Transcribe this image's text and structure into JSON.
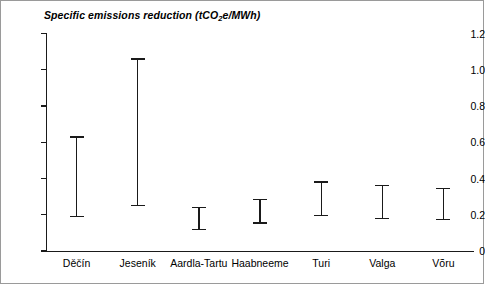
{
  "chart_data": {
    "type": "bar",
    "subtype": "error-bar-range",
    "title": "Specific emissions reduction (tCO2e/MWh)",
    "title_parts": {
      "before": "Specific emissions reduction (tCO",
      "sub": "2",
      "after": "e/MWh)"
    },
    "xlabel": "",
    "ylabel": "",
    "ylim": [
      0,
      1.2
    ],
    "ytick_labels": [
      "0",
      "0.2",
      "0.4",
      "0.6",
      "0.8",
      "1.0",
      "1.2"
    ],
    "ytick_values": [
      0,
      0.2,
      0.4,
      0.6,
      0.8,
      1.0,
      1.2
    ],
    "grid": false,
    "legend": "none",
    "categories": [
      "Děčín",
      "Jeseník",
      "Aardla-Tartu",
      "Haabneeme",
      "Turi",
      "Valga",
      "Võru"
    ],
    "series": [
      {
        "name": "low",
        "values": [
          0.19,
          0.25,
          0.12,
          0.155,
          0.195,
          0.18,
          0.175
        ]
      },
      {
        "name": "high",
        "values": [
          0.63,
          1.06,
          0.24,
          0.285,
          0.38,
          0.36,
          0.345
        ]
      }
    ],
    "points": [
      {
        "category": "Děčín",
        "low": 0.19,
        "high": 0.63
      },
      {
        "category": "Jeseník",
        "low": 0.25,
        "high": 1.06
      },
      {
        "category": "Aardla-Tartu",
        "low": 0.12,
        "high": 0.24
      },
      {
        "category": "Haabneeme",
        "low": 0.155,
        "high": 0.285
      },
      {
        "category": "Turi",
        "low": 0.195,
        "high": 0.38
      },
      {
        "category": "Valga",
        "low": 0.18,
        "high": 0.36
      },
      {
        "category": "Võru",
        "low": 0.175,
        "high": 0.345
      }
    ],
    "colors": {
      "marker": "#1a1a1a",
      "axis": "#1a1a1a",
      "background": "#ffffff",
      "border": "#9a9a9a"
    }
  }
}
